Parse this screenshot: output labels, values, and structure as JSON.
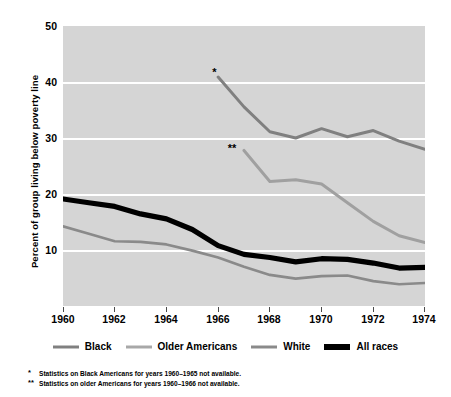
{
  "chart_data": {
    "type": "line",
    "title": "",
    "xlabel": "",
    "ylabel": "Percent of group living below poverty line",
    "xlim": [
      1960,
      1974
    ],
    "ylim": [
      5,
      50
    ],
    "grid": true,
    "legend_position": "bottom",
    "x_ticks": [
      "1960",
      "1962",
      "1964",
      "1966",
      "1968",
      "1970",
      "1972",
      "1974"
    ],
    "y_ticks": [
      "10",
      "20",
      "30",
      "40",
      "50"
    ],
    "series": [
      {
        "name": "Black",
        "color": "#808080",
        "width": 3,
        "marker_note": "*",
        "x": [
          1966,
          1967,
          1968,
          1969,
          1970,
          1971,
          1972,
          1973,
          1974
        ],
        "values": [
          41.8,
          37.0,
          33.0,
          32.0,
          33.5,
          32.2,
          33.2,
          31.5,
          30.2
        ]
      },
      {
        "name": "Older Americans",
        "color": "#a0a0a0",
        "width": 3,
        "marker_note": "**",
        "x": [
          1967,
          1968,
          1969,
          1970,
          1971,
          1972,
          1973,
          1974
        ],
        "values": [
          30.0,
          25.0,
          25.3,
          24.6,
          21.6,
          18.6,
          16.3,
          15.2
        ]
      },
      {
        "name": "White",
        "color": "#8a8a8a",
        "width": 2.6,
        "x": [
          1960,
          1961,
          1962,
          1963,
          1964,
          1965,
          1966,
          1967,
          1968,
          1969,
          1970,
          1971,
          1972,
          1973,
          1974
        ],
        "values": [
          17.8,
          16.6,
          15.4,
          15.3,
          14.9,
          13.9,
          12.8,
          11.3,
          10.0,
          9.4,
          9.8,
          9.9,
          9.0,
          8.5,
          8.7
        ]
      },
      {
        "name": "All races",
        "color": "#000000",
        "width": 5.2,
        "x": [
          1960,
          1961,
          1962,
          1963,
          1964,
          1965,
          1966,
          1967,
          1968,
          1969,
          1970,
          1971,
          1972,
          1973,
          1974
        ],
        "values": [
          22.2,
          21.6,
          21.0,
          19.8,
          19.0,
          17.3,
          14.7,
          13.3,
          12.8,
          12.1,
          12.6,
          12.5,
          11.9,
          11.1,
          11.2
        ]
      }
    ],
    "annotations": [
      {
        "label": "*",
        "x": 1966,
        "y": 42.6,
        "series": "Black"
      },
      {
        "label": "**",
        "x": 1966.6,
        "y": 30.4,
        "series": "Older Americans"
      }
    ]
  },
  "legend": {
    "items": [
      {
        "label": "Black",
        "color": "#808080",
        "thickness": "3px"
      },
      {
        "label": "Older Americans",
        "color": "#a8a8a8",
        "thickness": "3px"
      },
      {
        "label": "White",
        "color": "#8a8a8a",
        "thickness": "3px"
      },
      {
        "label": "All races",
        "color": "#000000",
        "thickness": "6px"
      }
    ]
  },
  "footnotes": [
    {
      "marker": "*",
      "text": "Statistics on Black Americans for years 1960–1965 not available."
    },
    {
      "marker": "**",
      "text": "Statistics on older Americans for years 1960–1966 not available."
    }
  ],
  "colors": {
    "plot_background": "#d5d5d5",
    "gridline": "#ffffff",
    "page_background": "#ffffff"
  }
}
